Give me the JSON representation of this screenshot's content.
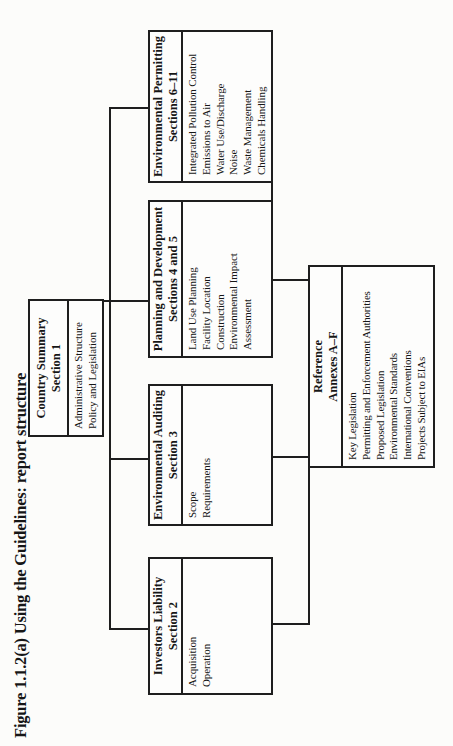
{
  "figure_title": "Figure 1.1.2(a)  Using the Guidelines: report structure",
  "diagram": {
    "line_color": "#1e1e1e",
    "boxes": {
      "country_summary": {
        "title": "Country Summary",
        "subtitle": "Section 1",
        "items": [
          "Administrative Structure",
          "Policy and Legislation"
        ]
      },
      "investors_liability": {
        "title": "Investors Liability",
        "subtitle": "Section 2",
        "items": [
          "Acquisition",
          "Operation"
        ]
      },
      "environmental_auditing": {
        "title": "Environmental Auditing",
        "subtitle": "Section 3",
        "items": [
          "Scope",
          "Requirements"
        ]
      },
      "planning_development": {
        "title": "Planning and Development",
        "subtitle": "Sections 4 and 5",
        "items": [
          "Land Use Planning",
          "Facility Location",
          "Construction",
          "Environmental Impact",
          "Assessment"
        ]
      },
      "environmental_permitting": {
        "title": "Environmental Permitting",
        "subtitle": "Sections 6–11",
        "items": [
          "Integrated Pollution Control",
          "Emissions to Air",
          "Water Use/Discharge",
          "Noise",
          "Waste Management",
          "Chemicals Handling"
        ]
      },
      "reference": {
        "title": "Reference",
        "subtitle": "Annexes A–F",
        "items": [
          "Key Legislation",
          "Permitting and Enforcement Authorities",
          "Proposed Legislation",
          "Environmental Standards",
          "International Conventions",
          "Projects Subject to EIAs"
        ]
      }
    }
  }
}
